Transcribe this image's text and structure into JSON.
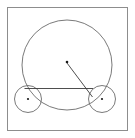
{
  "figure": {
    "type": "geometry-diagram",
    "title": "",
    "canvas": {
      "width": 135,
      "height": 138,
      "background": "#ffffff"
    },
    "frame": {
      "name": "outer-border-rectangle",
      "x": 7.5,
      "y": 7.5,
      "width": 120,
      "height": 123,
      "stroke": "#8d8d8d",
      "stroke_width": 1,
      "fill": "none"
    },
    "shapes": [
      {
        "name": "large-circle",
        "kind": "circle",
        "cx": 67,
        "cy": 65,
        "r": 45,
        "stroke": "#6b6b6b",
        "stroke_width": 0.9,
        "fill": "none"
      },
      {
        "name": "left-small-circle",
        "kind": "circle",
        "cx": 28,
        "cy": 99,
        "r": 13.5,
        "stroke": "#6b6b6b",
        "stroke_width": 0.9,
        "fill": "none"
      },
      {
        "name": "right-small-circle",
        "kind": "circle",
        "cx": 102,
        "cy": 99,
        "r": 13.5,
        "stroke": "#6b6b6b",
        "stroke_width": 0.9,
        "fill": "none"
      }
    ],
    "segments": [
      {
        "name": "horizontal-chord",
        "kind": "line",
        "x1": 24.5,
        "y1": 88.5,
        "x2": 93,
        "y2": 88.5,
        "stroke": "#3a3a3a",
        "stroke_width": 0.9
      },
      {
        "name": "radius-segment",
        "kind": "line",
        "x1": 67,
        "y1": 63,
        "x2": 92.5,
        "y2": 97,
        "stroke": "#3a3a3a",
        "stroke_width": 0.9
      }
    ],
    "points": [
      {
        "name": "large-circle-center-point",
        "cx": 67,
        "cy": 62,
        "r": 1.3,
        "fill": "#1a1a1a"
      },
      {
        "name": "left-small-circle-center-point",
        "cx": 28,
        "cy": 99,
        "r": 1.1,
        "fill": "#1a1a1a"
      },
      {
        "name": "right-small-circle-center-point",
        "cx": 102,
        "cy": 99,
        "r": 1.1,
        "fill": "#1a1a1a"
      }
    ]
  }
}
